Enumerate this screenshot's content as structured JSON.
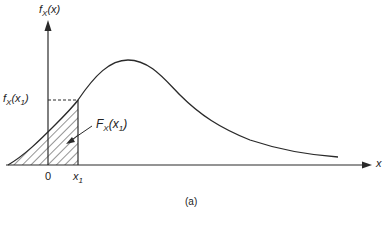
{
  "diagram": {
    "type": "probability-density-function",
    "y_axis_label": {
      "main": "f",
      "sub": "X",
      "arg": "(x)"
    },
    "x_axis_label": "x",
    "point_label_value": {
      "main": "f",
      "sub": "X",
      "arg_open": "(x",
      "arg_sub": "1",
      "arg_close": ")"
    },
    "area_label": {
      "main": "F",
      "sub": "X",
      "arg_open": "(x",
      "arg_sub": "1",
      "arg_close": ")"
    },
    "origin_label": "0",
    "x1_label": {
      "main": "x",
      "sub": "1"
    },
    "caption": "(a)",
    "colors": {
      "line": "#2a2a2a",
      "background": "#ffffff"
    }
  }
}
